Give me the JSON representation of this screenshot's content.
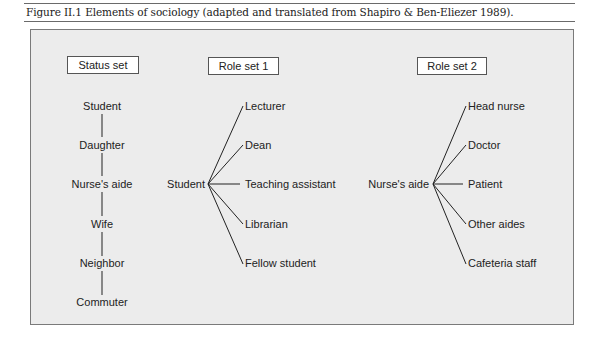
{
  "caption": "Figure II.1 Elements of sociology (adapted and translated from Shapiro & Ben-Eliezer 1989).",
  "status_set": {
    "title": "Status set",
    "items": [
      "Student",
      "Daughter",
      "Nurse's aide",
      "Wife",
      "Neighbor",
      "Commuter"
    ]
  },
  "role_set_1": {
    "title": "Role set 1",
    "hub": "Student",
    "roles": [
      "Lecturer",
      "Dean",
      "Teaching assistant",
      "Librarian",
      "Fellow student"
    ]
  },
  "role_set_2": {
    "title": "Role set 2",
    "hub": "Nurse's aide",
    "roles": [
      "Head nurse",
      "Doctor",
      "Patient",
      "Other aides",
      "Cafeteria staff"
    ]
  },
  "colors": {
    "panel_bg": "#ececec",
    "panel_border": "#7a7a7a",
    "line": "#222222",
    "text": "#222222"
  }
}
